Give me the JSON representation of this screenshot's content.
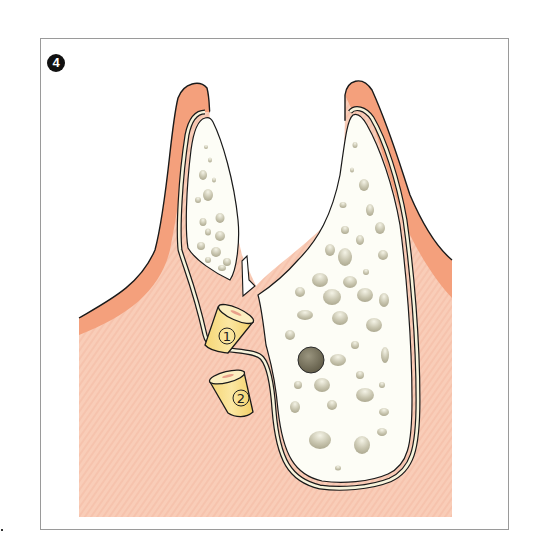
{
  "figure": {
    "step_number": "4",
    "cone_labels": [
      "1",
      "2"
    ],
    "labels_description": {
      "cone_1": "graft cone positioned at defect (circled 1)",
      "cone_2": "second graft cone below (circled 2)",
      "arrow": "downward-pointing outline arrow indicating insertion"
    }
  },
  "colors": {
    "soft_tissue": "#f9cdb8",
    "soft_tissue_stripe": "#f6c2ab",
    "gingiva_edge": "#f4a07c",
    "bone": "#fdfdf6",
    "periosteum": "#f5f2d8",
    "pore": "#b7b49c",
    "cone_fill": "#f8df88",
    "cone_top": "#fbeec0",
    "outline": "#1a1a1a",
    "foramen": "#76715c"
  }
}
